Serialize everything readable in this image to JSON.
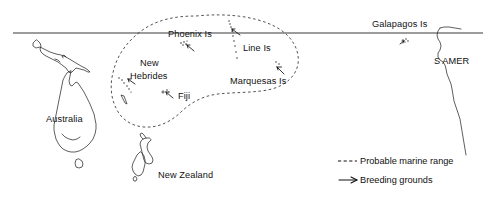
{
  "map": {
    "title": "Probable marine range and breeding grounds of a Pacific seabird",
    "projection_note": "Equirectangular Pacific Ocean sketch map",
    "background_color": "#ffffff",
    "ink_color": "#1a1a1a",
    "equator": {
      "name": "equator-line",
      "label": "",
      "y": 33,
      "x_start": 13,
      "x_end": 483,
      "color": "#3a3a3a"
    },
    "landmass_labels": [
      {
        "id": "australia",
        "text": "Australia",
        "x": 46,
        "y": 122
      },
      {
        "id": "new-zealand",
        "text": "New Zealand",
        "x": 158,
        "y": 178
      },
      {
        "id": "s-amer",
        "text": "S AMER",
        "x": 434,
        "y": 64
      }
    ],
    "island_group_labels": [
      {
        "id": "phoenix-is",
        "text": "Phoenix Is",
        "x": 168,
        "y": 37
      },
      {
        "id": "line-is",
        "text": "Line Is",
        "x": 243,
        "y": 51
      },
      {
        "id": "new-hebrides",
        "text": "New",
        "x": 140,
        "y": 66
      },
      {
        "id": "new-hebrides-2",
        "text": "Hebrides",
        "x": 130,
        "y": 79
      },
      {
        "id": "fiji",
        "text": "Fiji",
        "x": 178,
        "y": 99
      },
      {
        "id": "marquesas-is",
        "text": "Marquesas Is",
        "x": 230,
        "y": 84
      },
      {
        "id": "galapagos-is",
        "text": "Galapagos Is",
        "x": 372,
        "y": 27
      }
    ],
    "legend": {
      "name": "map-legend",
      "entries": [
        {
          "id": "probable-marine-range",
          "symbol": "dashed-line",
          "label": "Probable marine range",
          "x": 360,
          "y": 164
        },
        {
          "id": "breeding-grounds",
          "symbol": "arrow",
          "label": "Breeding grounds",
          "x": 360,
          "y": 183
        }
      ]
    },
    "breeding_ground_markers": [
      {
        "id": "marker-phoenix",
        "x": 187,
        "y": 48
      },
      {
        "id": "marker-line",
        "x": 233,
        "y": 32
      },
      {
        "id": "marker-marquesas",
        "x": 277,
        "y": 70
      },
      {
        "id": "marker-new-hebrides",
        "x": 128,
        "y": 82
      },
      {
        "id": "marker-fiji",
        "x": 167,
        "y": 95
      },
      {
        "id": "marker-galapagos",
        "x": 404,
        "y": 43
      }
    ],
    "colors": {
      "ink": "#1a1a1a",
      "equator": "#3a3a3a",
      "range_dash": "#333333",
      "paper": "#ffffff"
    }
  }
}
